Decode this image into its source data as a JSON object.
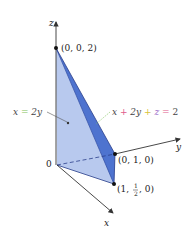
{
  "figure": {
    "type": "3d-region-diagram",
    "axes": {
      "x_label": "x",
      "y_label": "y",
      "z_label": "z",
      "origin_label": "0"
    },
    "points": [
      {
        "id": "apex",
        "label": "(0, 0, 2)"
      },
      {
        "id": "y_int",
        "label": "(0, 1, 0)"
      },
      {
        "id": "corner",
        "label_parts": [
          "(1, ",
          "1",
          "2",
          ", 0)"
        ]
      }
    ],
    "planes": [
      {
        "id": "plane_x2y",
        "label_parts": [
          "x",
          " = ",
          "2y"
        ],
        "colors": [
          "#444444",
          "#7fc35a",
          "#444444"
        ]
      },
      {
        "id": "plane_main",
        "label_parts": [
          "x",
          " + ",
          "2y",
          " + ",
          "z",
          " = ",
          "2"
        ],
        "colors": [
          "#444444",
          "#e05a8a",
          "#444444",
          "#d8c23a",
          "#9a6ac8",
          "#e05a8a",
          "#444444"
        ]
      }
    ],
    "colors": {
      "front_face": "#b8c9ee",
      "side_face": "#4e73cf",
      "bottom_face": "#a9bde9",
      "edge": "#2b3f8a",
      "axis": "#333333"
    }
  }
}
